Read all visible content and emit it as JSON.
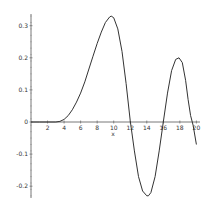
{
  "chart_data": {
    "type": "line",
    "title": "",
    "xlabel": "x",
    "ylabel": "",
    "xlim": [
      0,
      20
    ],
    "ylim": [
      -0.23,
      0.33
    ],
    "grid": false,
    "legend": null,
    "x_ticks": [
      "2",
      "4",
      "6",
      "8",
      "10",
      "12",
      "14",
      "16",
      "18",
      "20"
    ],
    "y_ticks": [
      "0.3",
      "0.2",
      "0.1",
      "0",
      "-0.1",
      "-0.2"
    ],
    "series": [
      {
        "name": "f(x)",
        "color": "#333333",
        "x": [
          0,
          1,
          2,
          3,
          3.5,
          4,
          4.5,
          5,
          5.5,
          6,
          6.5,
          7,
          7.5,
          8,
          8.5,
          9,
          9.5,
          9.7,
          10,
          10.5,
          11,
          11.5,
          12,
          12.5,
          13,
          13.5,
          14,
          14.2,
          14.5,
          15,
          15.5,
          16,
          16.5,
          17,
          17.5,
          17.9,
          18.3,
          18.7,
          19,
          19.3,
          19.6,
          20
        ],
        "y": [
          0,
          0,
          0,
          0,
          0.002,
          0.008,
          0.02,
          0.038,
          0.062,
          0.09,
          0.125,
          0.165,
          0.205,
          0.245,
          0.28,
          0.31,
          0.327,
          0.33,
          0.325,
          0.29,
          0.22,
          0.12,
          0.005,
          -0.09,
          -0.17,
          -0.215,
          -0.23,
          -0.23,
          -0.22,
          -0.17,
          -0.09,
          0.0,
          0.09,
          0.16,
          0.195,
          0.2,
          0.185,
          0.13,
          0.07,
          0.02,
          -0.01,
          -0.07
        ]
      }
    ]
  }
}
